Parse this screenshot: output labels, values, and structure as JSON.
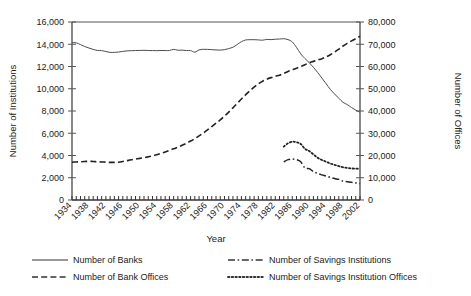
{
  "chart_data": {
    "type": "line",
    "title": "",
    "xlabel": "Year",
    "ylabel": "Number of Institutions",
    "y2label": "Number of Offices",
    "xlim": [
      1934,
      2002
    ],
    "ylim": [
      0,
      16000
    ],
    "y2lim": [
      0,
      80000
    ],
    "grid": false,
    "legend_position": "bottom",
    "xtick_labels": [
      "1934",
      "1938",
      "1942",
      "1946",
      "1950",
      "1954",
      "1958",
      "1962",
      "1966",
      "1970",
      "1974",
      "1978",
      "1982",
      "1986",
      "1990",
      "1994",
      "1998",
      "2002"
    ],
    "ytick_labels": [
      "0",
      "2,000",
      "4,000",
      "6,000",
      "8,000",
      "10,000",
      "12,000",
      "14,000",
      "16,000"
    ],
    "y2tick_labels": [
      "0",
      "10,000",
      "20,000",
      "30,000",
      "40,000",
      "50,000",
      "60,000",
      "70,000",
      "80,000"
    ],
    "x": [
      1934,
      1935,
      1936,
      1937,
      1938,
      1939,
      1940,
      1941,
      1942,
      1943,
      1944,
      1945,
      1946,
      1947,
      1948,
      1949,
      1950,
      1951,
      1952,
      1953,
      1954,
      1955,
      1956,
      1957,
      1958,
      1959,
      1960,
      1961,
      1962,
      1963,
      1964,
      1965,
      1966,
      1967,
      1968,
      1969,
      1970,
      1971,
      1972,
      1973,
      1974,
      1975,
      1976,
      1977,
      1978,
      1979,
      1980,
      1981,
      1982,
      1983,
      1984,
      1985,
      1986,
      1987,
      1988,
      1989,
      1990,
      1991,
      1992,
      1993,
      1994,
      1995,
      1996,
      1997,
      1998,
      1999,
      2000,
      2001,
      2002
    ],
    "series": [
      {
        "name": "Number of Banks",
        "axis": "left",
        "style": "solid",
        "color": "#4d4d4d",
        "values": [
          14146,
          14125,
          13973,
          13797,
          13661,
          13538,
          13442,
          13426,
          13346,
          13268,
          13268,
          13302,
          13359,
          13403,
          13419,
          13436,
          13446,
          13455,
          13439,
          13432,
          13423,
          13437,
          13437,
          13436,
          13540,
          13460,
          13472,
          13433,
          13432,
          13291,
          13493,
          13544,
          13538,
          13514,
          13487,
          13473,
          13511,
          13612,
          13733,
          13976,
          14230,
          14384,
          14411,
          14411,
          14391,
          14364,
          14434,
          14414,
          14451,
          14469,
          14496,
          14417,
          14210,
          13723,
          13137,
          12715,
          12347,
          11927,
          11466,
          10960,
          10452,
          9941,
          9528,
          9143,
          8774,
          8580,
          8315,
          8080,
          7887
        ]
      },
      {
        "name": "Number of Bank Offices",
        "axis": "right",
        "style": "dashed",
        "color": "#222222",
        "values": [
          17000,
          17100,
          17200,
          17300,
          17400,
          17300,
          17200,
          17100,
          17000,
          16900,
          16900,
          17000,
          17300,
          17700,
          18100,
          18400,
          18700,
          19000,
          19400,
          19800,
          20300,
          20900,
          21600,
          22300,
          23000,
          23800,
          24600,
          25500,
          26500,
          27600,
          28800,
          30100,
          31500,
          33000,
          34500,
          36000,
          37700,
          39500,
          41400,
          43400,
          45400,
          47300,
          49100,
          50700,
          52200,
          53400,
          54300,
          55000,
          55600,
          56100,
          56900,
          57800,
          58500,
          59200,
          60000,
          60800,
          61700,
          62300,
          62900,
          63500,
          64300,
          65300,
          66500,
          67800,
          69200,
          70400,
          71500,
          72500,
          73600
        ]
      },
      {
        "name": "Number of Savings Institutions",
        "axis": "left",
        "style": "dashdot",
        "color": "#222222",
        "start_year": 1984,
        "values_from_start": [
          3418,
          3626,
          3677,
          3626,
          3438,
          2878,
          2815,
          2561,
          2390,
          2262,
          2152,
          2030,
          1924,
          1852,
          1687,
          1642,
          1590,
          1534,
          1467
        ]
      },
      {
        "name": "Number of Savings Institution Offices",
        "axis": "right",
        "style": "dotted",
        "color": "#222222",
        "start_year": 1984,
        "values_from_start": [
          24000,
          25500,
          26200,
          26000,
          25200,
          23000,
          22000,
          20500,
          19000,
          18000,
          17200,
          16400,
          15800,
          15200,
          14700,
          14400,
          14200,
          14100,
          14000
        ]
      }
    ]
  },
  "axes": {
    "left_title": "Number of Institutions",
    "right_title": "Number of Offices",
    "x_title": "Year"
  },
  "legend": {
    "items": [
      {
        "label": "Number of Banks",
        "style": "solid"
      },
      {
        "label": "Number of Savings Institutions",
        "style": "dashdot"
      },
      {
        "label": "Number of Bank Offices",
        "style": "dashed"
      },
      {
        "label": "Number of Savings Institution Offices",
        "style": "dotted"
      }
    ]
  }
}
